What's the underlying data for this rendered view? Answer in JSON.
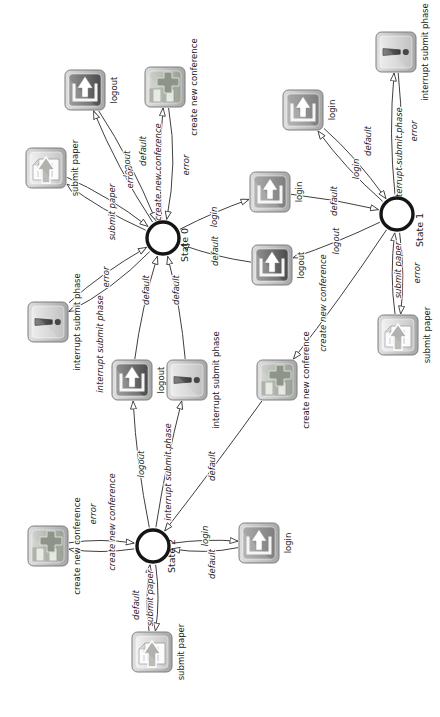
{
  "diagram": {
    "states": [
      {
        "id": "s0",
        "label": "State 0",
        "x": 479,
        "y": 163,
        "lx": 472,
        "ly": 185
      },
      {
        "id": "s1",
        "label": "State 1",
        "x": 503,
        "y": 397,
        "lx": 487,
        "ly": 420
      },
      {
        "id": "s2",
        "label": "State 2",
        "x": 171,
        "y": 153,
        "lx": 161,
        "ly": 172
      }
    ],
    "icons": [
      {
        "id": "i1",
        "type": "logout",
        "caption": "logout",
        "x": 627,
        "y": 85
      },
      {
        "id": "i2",
        "type": "conference",
        "caption": "create new conference",
        "x": 630,
        "y": 165
      },
      {
        "id": "i3",
        "type": "paper",
        "caption": "submit paper",
        "x": 549,
        "y": 46
      },
      {
        "id": "i4",
        "type": "interrupt",
        "caption": "interrupt submit phase",
        "x": 395,
        "y": 48
      },
      {
        "id": "i5",
        "type": "logout",
        "caption": "logout",
        "x": 337,
        "y": 132
      },
      {
        "id": "i6",
        "type": "interrupt",
        "caption": "interrupt submit phase",
        "x": 337,
        "y": 187
      },
      {
        "id": "i7",
        "type": "conference",
        "caption": "create new conference",
        "x": 337,
        "y": 277
      },
      {
        "id": "i8",
        "type": "login",
        "caption": "login",
        "x": 607,
        "y": 303
      },
      {
        "id": "i9",
        "type": "login",
        "caption": "login",
        "x": 525,
        "y": 270
      },
      {
        "id": "i10",
        "type": "logout",
        "caption": "logout",
        "x": 452,
        "y": 272
      },
      {
        "id": "i11",
        "type": "interrupt",
        "caption": "interrupt submit phase",
        "x": 665,
        "y": 396
      },
      {
        "id": "i12",
        "type": "paper",
        "caption": "submit paper",
        "x": 382,
        "y": 398
      },
      {
        "id": "i13",
        "type": "conference",
        "caption": "create new conference",
        "x": 171,
        "y": 48
      },
      {
        "id": "i14",
        "type": "paper",
        "caption": "submit paper",
        "x": 65,
        "y": 152
      },
      {
        "id": "i15",
        "type": "login",
        "caption": "login",
        "x": 174,
        "y": 259
      }
    ],
    "edges": [
      {
        "from": "s0",
        "to": "i1",
        "label": "logout",
        "bow": 8,
        "lx": 553,
        "ly": 127
      },
      {
        "from": "i1",
        "to": "s0",
        "label": "default",
        "bow": 8,
        "lx": 566,
        "ly": 143
      },
      {
        "from": "s0",
        "to": "i2",
        "label": "create new conference",
        "bow": 6,
        "lx": 545,
        "ly": 158
      },
      {
        "from": "i2",
        "to": "s0",
        "label": "error",
        "bow": 14,
        "lx": 552,
        "ly": 186
      },
      {
        "from": "s0",
        "to": "i3",
        "label": "submit paper",
        "bow": 8,
        "lx": 505,
        "ly": 112
      },
      {
        "from": "i3",
        "to": "s0",
        "label": "error",
        "bow": 8,
        "lx": 539,
        "ly": 130
      },
      {
        "from": "s0",
        "to": "i4",
        "label": "interrupt submit phase",
        "bow": 12,
        "lx": 373,
        "ly": 100
      },
      {
        "from": "i4",
        "to": "s0",
        "label": "error",
        "bow": 8,
        "lx": 440,
        "ly": 106
      },
      {
        "from": "s0",
        "to": "i9",
        "label": "login",
        "bow": 4,
        "lx": 500,
        "ly": 214
      },
      {
        "from": "i9",
        "to": "s1",
        "label": "default",
        "bow": 4,
        "lx": 516,
        "ly": 334
      },
      {
        "from": "s1",
        "to": "i8",
        "label": "login",
        "bow": 8,
        "lx": 548,
        "ly": 356
      },
      {
        "from": "i8",
        "to": "s1",
        "label": "default",
        "bow": 8,
        "lx": 576,
        "ly": 368
      },
      {
        "from": "s1",
        "to": "i11",
        "label": "interrupt submit phase",
        "bow": 8,
        "lx": 561,
        "ly": 399
      },
      {
        "from": "i11",
        "to": "s1",
        "label": "error",
        "bow": 8,
        "lx": 586,
        "ly": 414
      },
      {
        "from": "s1",
        "to": "i12",
        "label": "submit paper",
        "bow": 8,
        "lx": 447,
        "ly": 398
      },
      {
        "from": "i12",
        "to": "s1",
        "label": "error",
        "bow": 8,
        "lx": 444,
        "ly": 417
      },
      {
        "from": "s1",
        "to": "i10",
        "label": "logout",
        "bow": 4,
        "lx": 476,
        "ly": 336
      },
      {
        "from": "i10",
        "to": "s0",
        "label": "default",
        "bow": 6,
        "lx": 466,
        "ly": 215
      },
      {
        "from": "s1",
        "to": "i7",
        "label": "create new conference",
        "bow": 4,
        "lx": 414,
        "ly": 323
      },
      {
        "from": "i7",
        "to": "s2",
        "label": "default",
        "bow": 2,
        "lx": 251,
        "ly": 212
      },
      {
        "from": "s2",
        "to": "i5",
        "label": "logout",
        "bow": 6,
        "lx": 253,
        "ly": 141
      },
      {
        "from": "i5",
        "to": "s0",
        "label": "default",
        "bow": 6,
        "lx": 427,
        "ly": 146
      },
      {
        "from": "s2",
        "to": "i6",
        "label": "interrupt submit phase",
        "bow": 4,
        "lx": 245,
        "ly": 168
      },
      {
        "from": "i6",
        "to": "s0",
        "label": "default",
        "bow": -6,
        "lx": 427,
        "ly": 176
      },
      {
        "from": "s2",
        "to": "i13",
        "label": "create new conference",
        "bow": 8,
        "lx": 195,
        "ly": 112
      },
      {
        "from": "i13",
        "to": "s2",
        "label": "error",
        "bow": 8,
        "lx": 203,
        "ly": 93
      },
      {
        "from": "s2",
        "to": "i14",
        "label": "submit paper",
        "bow": 8,
        "lx": 119,
        "ly": 150
      },
      {
        "from": "i14",
        "to": "s2",
        "label": "default",
        "bow": 8,
        "lx": 112,
        "ly": 136
      },
      {
        "from": "s2",
        "to": "i15",
        "label": "login",
        "bow": 6,
        "lx": 181,
        "ly": 205
      },
      {
        "from": "i15",
        "to": "s2",
        "label": "default",
        "bow": 10,
        "lx": 153,
        "ly": 212
      }
    ],
    "colors": {
      "background": "#ffffff",
      "edge": "#3f3f3f",
      "text": "#1c1c1c",
      "icon_frame": "#c2c2c2",
      "login_bg": "#8f8f8f",
      "logout_bg": "#5c5c5c",
      "submit_paper_bg": "#d9d9d9",
      "conference_bg": "#a8aea2",
      "interrupt_bg": "#d6d6d6",
      "state_stroke": "#151515"
    }
  }
}
